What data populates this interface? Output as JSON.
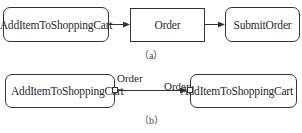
{
  "diagram_a": {
    "nodes": [
      {
        "id": "a1",
        "label": "AddItemToShoppingCart",
        "shape": "rounded"
      },
      {
        "id": "a2",
        "label": "Order",
        "shape": "rectangle"
      },
      {
        "id": "a3",
        "label": "SubmitOrder",
        "shape": "rounded"
      }
    ],
    "edges": [
      {
        "from": "a1",
        "to": "a2"
      },
      {
        "from": "a2",
        "to": "a3"
      }
    ],
    "caption": "（a）"
  },
  "diagram_b": {
    "nodes": [
      {
        "id": "b1",
        "label": "AddItemToShoppingCart",
        "shape": "rounded",
        "output_pin": "Order"
      },
      {
        "id": "b2",
        "label": "AddItemToShoppingCart",
        "shape": "rounded",
        "input_pin": "Order"
      }
    ],
    "edges": [
      {
        "from": "b1.Order",
        "to": "b2.Order"
      }
    ],
    "caption": "（b）"
  }
}
